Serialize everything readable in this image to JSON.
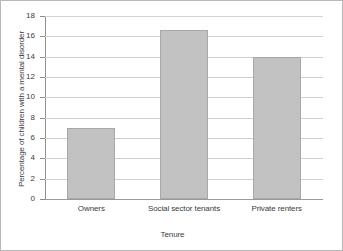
{
  "chart_data": {
    "type": "bar",
    "title": "",
    "subtitle": "",
    "xlabel": "Tenure",
    "ylabel": "Percentage of children with a mental disorder",
    "categories": [
      "Owners",
      "Social sector tenants",
      "Private renters"
    ],
    "values": [
      7.0,
      16.6,
      14.0
    ],
    "ylim": [
      0,
      18
    ],
    "ytick_values": [
      0,
      2,
      4,
      6,
      8,
      10,
      12,
      14,
      16,
      18
    ],
    "ytick_labels": [
      "0",
      "2",
      "4",
      "6",
      "8",
      "10",
      "12",
      "14",
      "16",
      "18"
    ],
    "grid": true,
    "legend": false,
    "legend_position": "none",
    "bar_color": "#c2c2c2",
    "bar_border_color": "#a8a8a8",
    "grid_color": "#d2d2d2",
    "axis_color": "#8e8e8e",
    "text_color": "#3b3b3b",
    "frame_color": "#b8b8b8",
    "background": "#ffffff"
  }
}
